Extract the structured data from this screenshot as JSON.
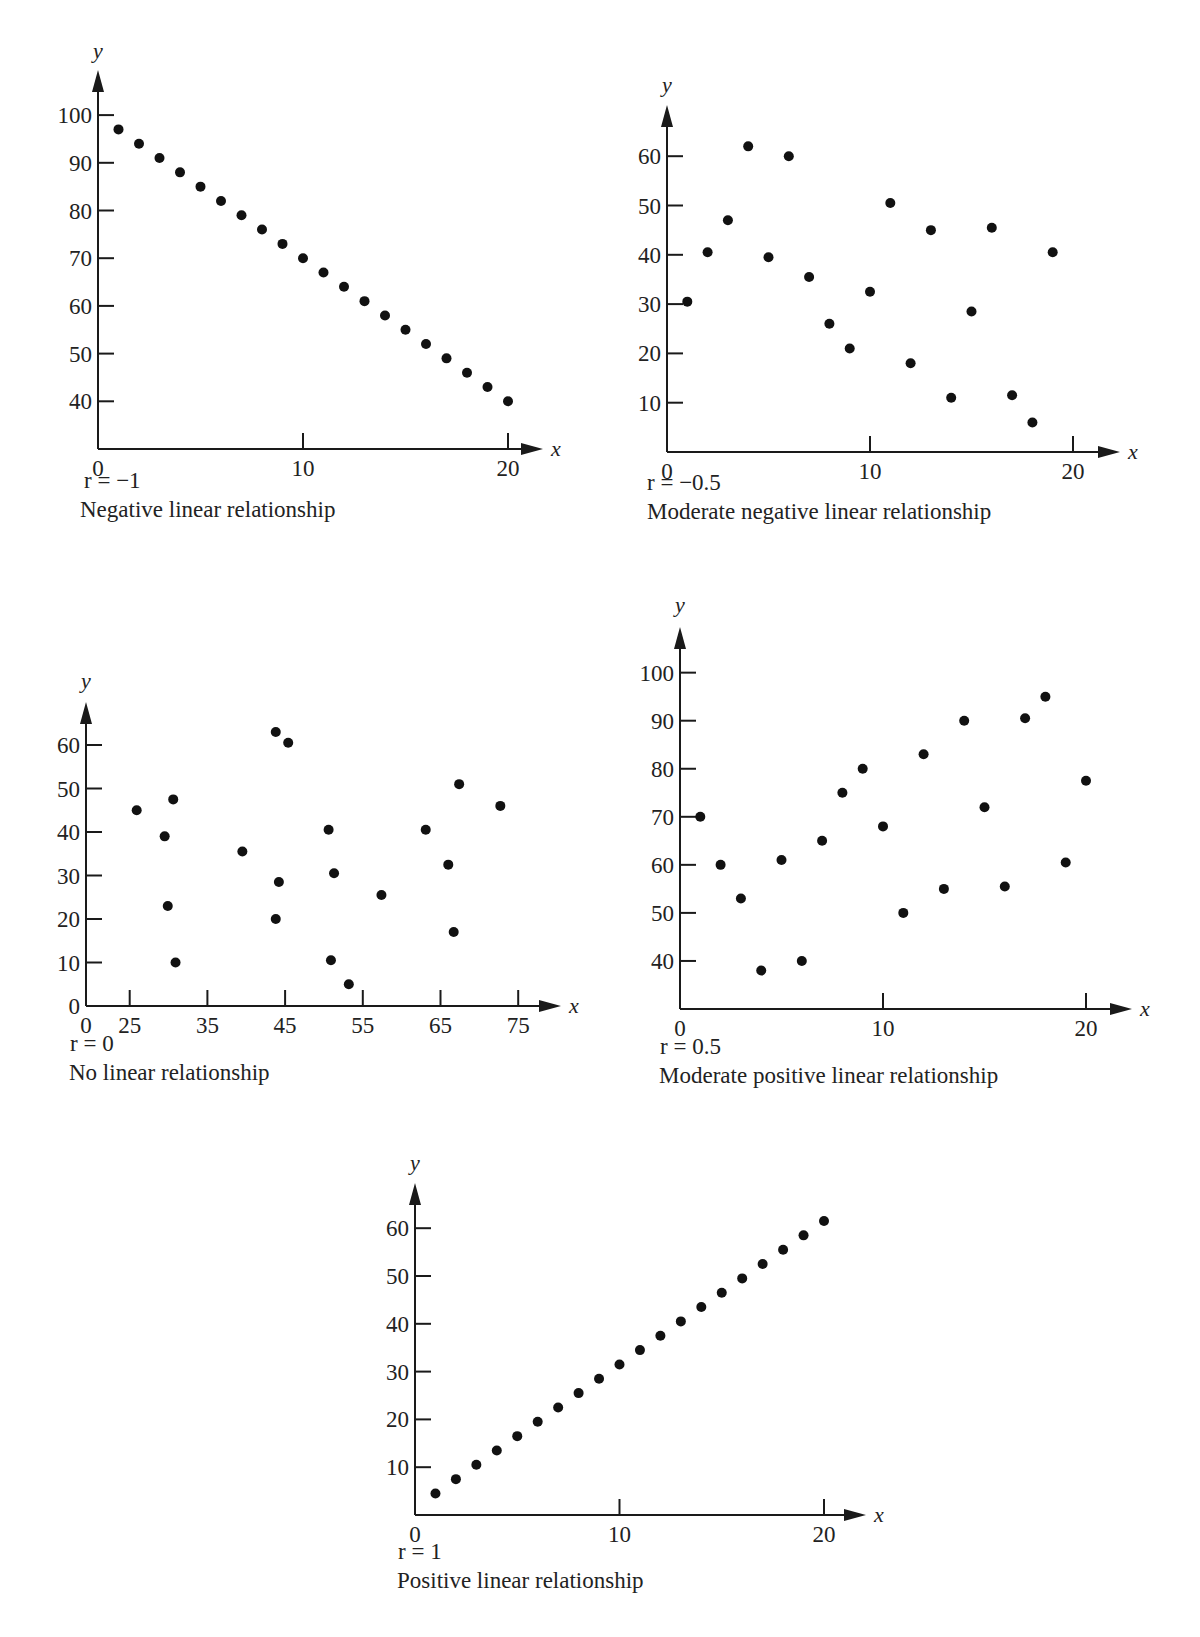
{
  "chart_data": [
    {
      "type": "scatter",
      "title": "",
      "r_label": "r = −1",
      "caption": "Negative linear relationship",
      "xlabel": "x",
      "ylabel": "y",
      "x_ticks": [
        0,
        10,
        20
      ],
      "y_ticks": [
        40,
        50,
        60,
        70,
        80,
        90,
        100
      ],
      "xlim": [
        0,
        21
      ],
      "ylim": [
        30,
        108
      ],
      "grid": false,
      "x": [
        1,
        2,
        3,
        4,
        5,
        6,
        7,
        8,
        9,
        10,
        11,
        12,
        13,
        14,
        15,
        16,
        17,
        18,
        19,
        20
      ],
      "y": [
        97,
        94,
        91,
        88,
        85,
        82,
        79,
        76,
        73,
        70,
        67,
        64,
        61,
        58,
        55,
        52,
        49,
        46,
        43,
        40
      ]
    },
    {
      "type": "scatter",
      "title": "",
      "r_label": "r = −0.5",
      "caption": "Moderate negative linear relationship",
      "xlabel": "x",
      "ylabel": "y",
      "x_ticks": [
        0,
        10,
        20
      ],
      "y_ticks": [
        10,
        20,
        30,
        40,
        50,
        60
      ],
      "xlim": [
        0,
        22
      ],
      "ylim": [
        0,
        70
      ],
      "grid": false,
      "x": [
        1,
        2,
        3,
        4,
        5,
        6,
        7,
        8,
        9,
        10,
        11,
        12,
        13,
        14,
        15,
        16,
        17,
        18,
        19
      ],
      "y": [
        30.5,
        40.5,
        47,
        62,
        39.5,
        60,
        35.5,
        26,
        21,
        32.5,
        50.5,
        18,
        45,
        11,
        28.5,
        45.5,
        11.5,
        6,
        40.5
      ]
    },
    {
      "type": "scatter",
      "title": "",
      "r_label": "r = 0",
      "caption": "No linear relationship",
      "xlabel": "x",
      "ylabel": "y",
      "x_ticks": [
        0,
        25,
        35,
        45,
        55,
        65,
        75
      ],
      "y_ticks": [
        0,
        10,
        20,
        30,
        40,
        50,
        60
      ],
      "xlim": [
        0,
        80
      ],
      "ylim": [
        0,
        70
      ],
      "grid": false,
      "x": [
        25.9,
        29.5,
        30.6,
        29.9,
        30.9,
        39.5,
        43.8,
        45.4,
        44.2,
        43.8,
        50.6,
        51.3,
        50.9,
        53.2,
        57.4,
        63.1,
        66.0,
        66.7,
        67.4,
        72.7
      ],
      "y": [
        45,
        39,
        47.5,
        23,
        10,
        35.5,
        63,
        60.5,
        28.5,
        20,
        40.5,
        30.5,
        10.5,
        5,
        25.5,
        40.5,
        32.5,
        17,
        51,
        46
      ]
    },
    {
      "type": "scatter",
      "title": "",
      "r_label": "r = 0.5",
      "caption": "Moderate positive linear relationship",
      "xlabel": "x",
      "ylabel": "y",
      "x_ticks": [
        0,
        10,
        20
      ],
      "y_ticks": [
        40,
        50,
        60,
        70,
        80,
        90,
        100
      ],
      "xlim": [
        0,
        22
      ],
      "ylim": [
        30,
        108
      ],
      "grid": false,
      "x": [
        1,
        2,
        3,
        4,
        5,
        6,
        7,
        8,
        9,
        10,
        11,
        12,
        13,
        14,
        15,
        16,
        17,
        18,
        19,
        20
      ],
      "y": [
        70,
        60,
        53,
        38,
        61,
        40,
        65,
        75,
        80,
        68,
        50,
        83,
        55,
        90,
        72,
        55.5,
        90.5,
        95,
        60.5,
        77.5
      ]
    },
    {
      "type": "scatter",
      "title": "",
      "r_label": "r = 1",
      "caption": "Positive linear relationship",
      "xlabel": "x",
      "ylabel": "y",
      "x_ticks": [
        0,
        10,
        20
      ],
      "y_ticks": [
        10,
        20,
        30,
        40,
        50,
        60
      ],
      "xlim": [
        0,
        22
      ],
      "ylim": [
        0,
        70
      ],
      "grid": false,
      "x": [
        1,
        2,
        3,
        4,
        5,
        6,
        7,
        8,
        9,
        10,
        11,
        12,
        13,
        14,
        15,
        16,
        17,
        18,
        19,
        20
      ],
      "y": [
        4.5,
        7.5,
        10.5,
        13.5,
        16.5,
        19.5,
        22.5,
        25.5,
        28.5,
        31.5,
        34.5,
        37.5,
        40.5,
        43.5,
        46.5,
        49.5,
        52.5,
        55.5,
        58.5,
        61.5
      ]
    }
  ]
}
